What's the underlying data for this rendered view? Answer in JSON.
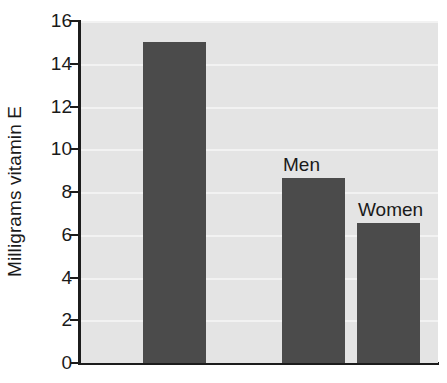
{
  "chart_data": {
    "type": "bar",
    "title": "",
    "xlabel": "",
    "ylabel": "Milligrams vitamin E",
    "ylim": [
      0,
      16
    ],
    "yticks": [
      0,
      2,
      4,
      6,
      8,
      10,
      12,
      14,
      16
    ],
    "grid": true,
    "legend": "none",
    "categories": [
      "",
      "Men",
      "Women"
    ],
    "values": [
      15.0,
      8.65,
      6.55
    ],
    "bar_color": "#4b4b4b",
    "plot_background": "#e4e4e4",
    "gridline_color": "#f2f2f2",
    "axis_color": "#1c1c1c",
    "annotations": [
      {
        "text": "Men",
        "bar_index": 1
      },
      {
        "text": "Women",
        "bar_index": 2
      }
    ]
  }
}
